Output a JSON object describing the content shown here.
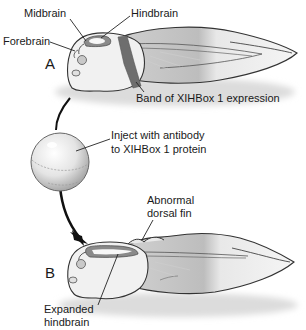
{
  "diagram": {
    "panel_a": {
      "letter": "A",
      "labels": {
        "midbrain": "Midbrain",
        "hindbrain": "Hindbrain",
        "forebrain": "Forebrain",
        "band": "Band of XIHBox 1 expression"
      }
    },
    "injection": {
      "label_line1": "Inject with antibody",
      "label_line2": "to XIHBox 1 protein"
    },
    "panel_b": {
      "letter": "B",
      "labels": {
        "dorsal_fin_line1": "Abnormal",
        "dorsal_fin_line2": "dorsal fin",
        "hindbrain_line1": "Expanded",
        "hindbrain_line2": "hindbrain"
      }
    },
    "colors": {
      "outline": "#333333",
      "body_fill": "#f2f2f2",
      "shade": "#b8b8b8",
      "band": "#6e6e6e",
      "brain": "#8a8a8a",
      "arrow": "#111111"
    }
  }
}
